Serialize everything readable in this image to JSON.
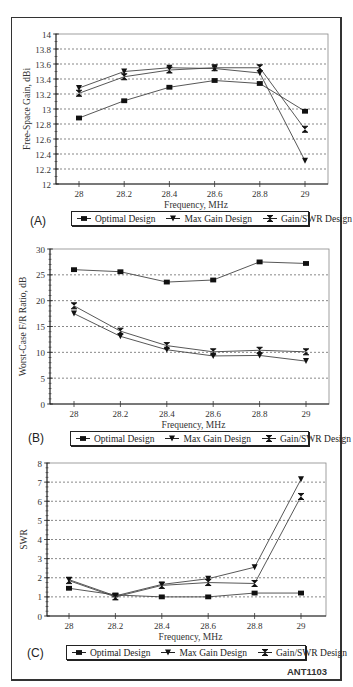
{
  "figure_id": "ANT1103",
  "series_style": {
    "Optimal Design": {
      "marker": "square",
      "color": "#111111"
    },
    "Max Gain Design": {
      "marker": "triangle-down",
      "color": "#111111"
    },
    "Gain/SWR Design": {
      "marker": "hourglass",
      "color": "#111111"
    }
  },
  "legend": [
    {
      "label": "Optimal Design",
      "marker": "square"
    },
    {
      "label": "Max Gain Design",
      "marker": "triangle-down"
    },
    {
      "label": "Gain/SWR Design",
      "marker": "hourglass"
    }
  ],
  "panels": [
    {
      "label": "(A)"
    },
    {
      "label": "(B)"
    },
    {
      "label": "(C)"
    }
  ],
  "chart_data": [
    {
      "type": "line",
      "panel": "(A)",
      "title": "",
      "xlabel": "Frequency, MHz",
      "ylabel": "Free-Space Gain, dBi",
      "x": [
        28,
        28.2,
        28.4,
        28.6,
        28.8,
        29
      ],
      "x_tick_labels": [
        "28",
        "28.2",
        "28.4",
        "28.6",
        "28.8",
        "29"
      ],
      "ylim": [
        12,
        14
      ],
      "y_ticks": [
        12,
        12.2,
        12.4,
        12.6,
        12.8,
        13,
        13.2,
        13.4,
        13.6,
        13.8,
        14
      ],
      "y_tick_labels": [
        "12",
        "12.2",
        "12.4",
        "12.6",
        "12.8",
        "13",
        "13.2",
        "13.4",
        "13.6",
        "13.8",
        "14"
      ],
      "grid": "horizontal dashed",
      "legend_position": "bottom",
      "series": [
        {
          "name": "Optimal Design",
          "values": [
            12.88,
            13.11,
            13.29,
            13.38,
            13.34,
            12.97
          ]
        },
        {
          "name": "Max Gain Design",
          "values": [
            13.28,
            13.5,
            13.55,
            13.54,
            13.48,
            12.31
          ]
        },
        {
          "name": "Gain/SWR Design",
          "values": [
            13.21,
            13.43,
            13.52,
            13.55,
            13.55,
            12.73
          ]
        }
      ]
    },
    {
      "type": "line",
      "panel": "(B)",
      "title": "",
      "xlabel": "Frequency, MHz",
      "ylabel": "Worst-Case F/R Ratio, dB",
      "x": [
        28,
        28.2,
        28.4,
        28.6,
        28.8,
        29
      ],
      "x_tick_labels": [
        "28",
        "28.2",
        "28.4",
        "28.6",
        "28.8",
        "29"
      ],
      "ylim": [
        0,
        30
      ],
      "y_ticks": [
        0,
        5,
        10,
        15,
        20,
        25,
        30
      ],
      "y_tick_labels": [
        "0",
        "5",
        "10",
        "15",
        "20",
        "25",
        "30"
      ],
      "grid": "horizontal dashed",
      "legend_position": "bottom",
      "series": [
        {
          "name": "Optimal Design",
          "values": [
            26.0,
            25.6,
            23.6,
            24.0,
            27.5,
            27.2
          ]
        },
        {
          "name": "Max Gain Design",
          "values": [
            17.5,
            13.1,
            10.5,
            9.3,
            9.4,
            8.3
          ]
        },
        {
          "name": "Gain/SWR Design",
          "values": [
            19.0,
            14.1,
            11.3,
            10.1,
            10.4,
            10.1
          ]
        }
      ]
    },
    {
      "type": "line",
      "panel": "(C)",
      "title": "",
      "xlabel": "Frequency, MHz",
      "ylabel": "SWR",
      "x": [
        28,
        28.2,
        28.4,
        28.6,
        28.8,
        29
      ],
      "x_tick_labels": [
        "28",
        "28.2",
        "28.4",
        "28.6",
        "28.8",
        "29"
      ],
      "ylim": [
        0,
        8
      ],
      "y_ticks": [
        0,
        1,
        2,
        3,
        4,
        5,
        6,
        7,
        8
      ],
      "y_tick_labels": [
        "0",
        "1",
        "2",
        "3",
        "4",
        "5",
        "6",
        "7",
        "8"
      ],
      "grid": "horizontal dashed",
      "legend_position": "bottom",
      "series": [
        {
          "name": "Optimal Design",
          "values": [
            1.45,
            1.1,
            1.0,
            1.0,
            1.2,
            1.2
          ]
        },
        {
          "name": "Max Gain Design",
          "values": [
            1.9,
            1.05,
            1.65,
            1.95,
            2.55,
            7.15
          ]
        },
        {
          "name": "Gain/SWR Design",
          "values": [
            1.85,
            1.0,
            1.6,
            1.75,
            1.7,
            6.25
          ]
        }
      ]
    }
  ]
}
